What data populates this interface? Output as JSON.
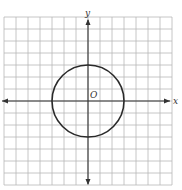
{
  "figure": {
    "type": "coordinate-plane",
    "grid": {
      "columns": 14,
      "rows": 14,
      "x_min": -7,
      "x_max": 7,
      "y_min": -7,
      "y_max": 7,
      "cell_px": 12
    },
    "axes": {
      "x_label": "x",
      "y_label": "y",
      "origin_label": "O"
    },
    "circle": {
      "center": [
        0,
        0
      ],
      "radius": 3
    },
    "colors": {
      "grid": "#b8b8b8",
      "axis": "#333333",
      "circle": "#2a2a2a",
      "background": "#ffffff"
    }
  }
}
